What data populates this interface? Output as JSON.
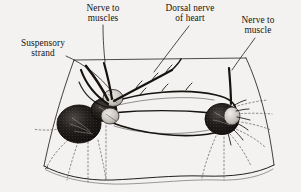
{
  "figure": {
    "kind": "anatomical-line-drawing",
    "background_color": "#f3f2f0",
    "ink_color": "#16120f",
    "labels": [
      {
        "id": "nerve-to-muscles",
        "line1": "Nerve to",
        "line2": "muscles"
      },
      {
        "id": "dorsal-nerve-of-heart",
        "line1": "Dorsal nerve",
        "line2": "of heart"
      },
      {
        "id": "nerve-to-muscle",
        "line1": "Nerve to",
        "line2": "muscle"
      },
      {
        "id": "suspensory-strand",
        "line1": "Suspensory",
        "line2": "strand"
      }
    ]
  }
}
